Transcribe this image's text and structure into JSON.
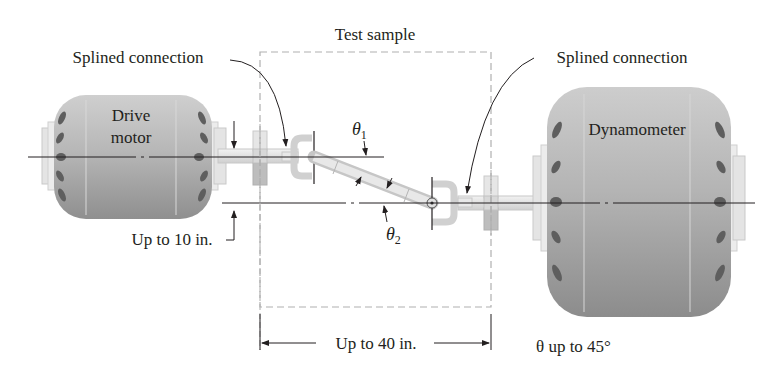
{
  "diagram": {
    "type": "mechanical-schematic",
    "labels": {
      "test_sample": "Test sample",
      "splined_left": "Splined connection",
      "splined_right": "Splined connection",
      "drive_motor_line1": "Drive",
      "drive_motor_line2": "motor",
      "dynamometer": "Dynamometer",
      "offset": "Up to 10 in.",
      "length": "Up to 40 in.",
      "theta1_sym": "θ",
      "theta1_sub": "1",
      "theta2_sym": "θ",
      "theta2_sub": "2",
      "theta_note": "θ up to 45°"
    },
    "components": [
      {
        "name": "Drive motor",
        "position": "left",
        "axis": "upper"
      },
      {
        "name": "Test sample (U-joint shaft)",
        "position": "center",
        "enclosure": "dashed box"
      },
      {
        "name": "Dynamometer",
        "position": "right",
        "axis": "lower"
      }
    ],
    "dimensions": {
      "axis_offset_max": "10 in.",
      "test_length_max": "40 in.",
      "theta_max": "45°"
    },
    "colors": {
      "ink": "#231f20",
      "body_fill": "#b9b9b9",
      "body_dark": "#8d8d8d",
      "part_light": "#e4e4e4",
      "vent": "#5e5e5e",
      "dash": "#b0b0b0"
    }
  }
}
